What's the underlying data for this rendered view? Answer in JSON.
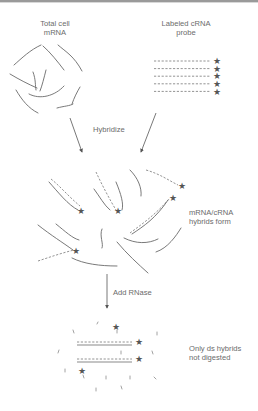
{
  "diagram": {
    "labels": {
      "total_mrna": [
        "Total cell",
        "mRNA"
      ],
      "probe": [
        "Labeled cRNA",
        "probe"
      ],
      "hybridize": "Hybridize",
      "hybrids_form": [
        "mRNA/cRNA",
        "hybrids form"
      ],
      "add_rnase": "Add RNase",
      "only_ds": [
        "Only ds hybrids",
        "not digested"
      ]
    },
    "probe_count": 5,
    "star_glyph": "★",
    "steps": [
      "Total cell mRNA + Labeled cRNA probe",
      "Hybridize",
      "mRNA/cRNA hybrids form",
      "Add RNase",
      "Only ds hybrids not digested"
    ]
  }
}
